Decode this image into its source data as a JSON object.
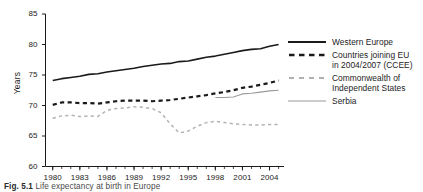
{
  "figure": {
    "caption_label": "Fig. 5.1",
    "caption_text": "Life expectancy at birth in Europe"
  },
  "chart_data": {
    "type": "line",
    "title": "",
    "xlabel": "",
    "ylabel": "Years",
    "xlim": [
      1979.2,
      2005.6
    ],
    "ylim": [
      60,
      85
    ],
    "yticks": [
      60,
      65,
      70,
      75,
      80,
      85
    ],
    "ytick_labels": [
      "60",
      "65",
      "70",
      "75",
      "80",
      "85"
    ],
    "xticks": [
      1980,
      1983,
      1986,
      1989,
      1992,
      1995,
      1998,
      2001,
      2004
    ],
    "xtick_labels": [
      "1980",
      "1983",
      "1986",
      "1989",
      "1992",
      "1995",
      "1998",
      "2001",
      "2004"
    ],
    "minor_xticks_every": 1,
    "grid": false,
    "legend_position": "right",
    "x": [
      1980,
      1981,
      1982,
      1983,
      1984,
      1985,
      1986,
      1987,
      1988,
      1989,
      1990,
      1991,
      1992,
      1993,
      1994,
      1995,
      1996,
      1997,
      1998,
      1999,
      2000,
      2001,
      2002,
      2003,
      2004,
      2005
    ],
    "series": [
      {
        "name": "Western Europe",
        "style": "solid",
        "color": "#1a1a1a",
        "width": 1.6,
        "x": [
          1980,
          1981,
          1982,
          1983,
          1984,
          1985,
          1986,
          1987,
          1988,
          1989,
          1990,
          1991,
          1992,
          1993,
          1994,
          1995,
          1996,
          1997,
          1998,
          1999,
          2000,
          2001,
          2002,
          2003,
          2004,
          2005
        ],
        "values": [
          74.1,
          74.4,
          74.6,
          74.8,
          75.1,
          75.2,
          75.5,
          75.7,
          75.9,
          76.1,
          76.4,
          76.6,
          76.8,
          76.9,
          77.2,
          77.3,
          77.6,
          77.9,
          78.1,
          78.4,
          78.7,
          79.0,
          79.2,
          79.3,
          79.7,
          80.0
        ]
      },
      {
        "name": "Countries joining EU in 2004/2007 (CCEE)",
        "name_line1": "Countries joining EU",
        "name_line2": "in 2004/2007 (CCEE)",
        "style": "dashed",
        "color": "#1a1a1a",
        "width": 2.2,
        "x": [
          1980,
          1981,
          1982,
          1983,
          1984,
          1985,
          1986,
          1987,
          1988,
          1989,
          1990,
          1991,
          1992,
          1993,
          1994,
          1995,
          1996,
          1997,
          1998,
          1999,
          2000,
          2001,
          2002,
          2003,
          2004,
          2005
        ],
        "values": [
          70.1,
          70.5,
          70.5,
          70.4,
          70.4,
          70.3,
          70.5,
          70.7,
          70.8,
          70.8,
          70.8,
          70.7,
          70.8,
          70.9,
          71.1,
          71.3,
          71.5,
          71.7,
          72.0,
          72.2,
          72.5,
          72.9,
          73.1,
          73.4,
          73.7,
          74.1
        ]
      },
      {
        "name": "Commonwealth of Independent States",
        "name_line1": "Commonwealth of",
        "name_line2": "Independent States",
        "style": "dashed",
        "color": "#b3b3b3",
        "width": 1.5,
        "x": [
          1980,
          1981,
          1982,
          1983,
          1984,
          1985,
          1986,
          1987,
          1988,
          1989,
          1990,
          1991,
          1992,
          1993,
          1994,
          1995,
          1996,
          1997,
          1998,
          1999,
          2000,
          2001,
          2002,
          2003,
          2004,
          2005
        ],
        "values": [
          67.9,
          68.3,
          68.4,
          68.2,
          68.3,
          68.2,
          69.2,
          69.5,
          69.6,
          69.8,
          69.7,
          69.5,
          68.8,
          67.0,
          65.5,
          65.8,
          66.6,
          67.2,
          67.4,
          67.2,
          67.0,
          66.9,
          66.8,
          66.8,
          66.9,
          66.9
        ]
      },
      {
        "name": "Serbia",
        "style": "solid",
        "color": "#9a9a9a",
        "width": 1.1,
        "x": [
          1998,
          1999,
          2000,
          2001,
          2002,
          2003,
          2004,
          2005
        ],
        "values": [
          71.3,
          71.3,
          71.4,
          71.9,
          72.0,
          72.2,
          72.4,
          72.5
        ]
      }
    ]
  },
  "legend": {
    "entries": [
      {
        "swatch": "legend-swatch-western-europe",
        "line1": "Western Europe",
        "line2": ""
      },
      {
        "swatch": "legend-swatch-ccee",
        "line1": "Countries joining EU",
        "line2": "in 2004/2007 (CCEE)"
      },
      {
        "swatch": "legend-swatch-cis",
        "line1": "Commonwealth of",
        "line2": "Independent States"
      },
      {
        "swatch": "legend-swatch-serbia",
        "line1": "Serbia",
        "line2": ""
      }
    ]
  }
}
